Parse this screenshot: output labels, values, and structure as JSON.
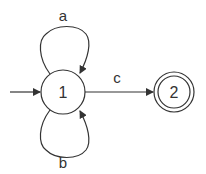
{
  "diagram": {
    "type": "finite-automaton",
    "colors": {
      "stroke": "#333333",
      "background": "#ffffff"
    },
    "states": [
      {
        "id": "1",
        "label": "1",
        "initial": true,
        "accepting": false
      },
      {
        "id": "2",
        "label": "2",
        "initial": false,
        "accepting": true
      }
    ],
    "transitions": [
      {
        "from": "1",
        "to": "1",
        "label": "a",
        "position": "top-loop"
      },
      {
        "from": "1",
        "to": "1",
        "label": "b",
        "position": "bottom-loop"
      },
      {
        "from": "1",
        "to": "2",
        "label": "c"
      }
    ]
  }
}
